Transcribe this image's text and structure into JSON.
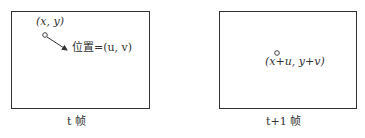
{
  "diagram": {
    "frames": [
      {
        "caption": "t 帧",
        "point_label": "(x, y)",
        "motion_label": "位置=(u, v)"
      },
      {
        "caption": "t+1 帧",
        "point_label": "(x+u, y+v)"
      }
    ],
    "colors": {
      "stroke": "#333333",
      "background": "#ffffff"
    }
  }
}
